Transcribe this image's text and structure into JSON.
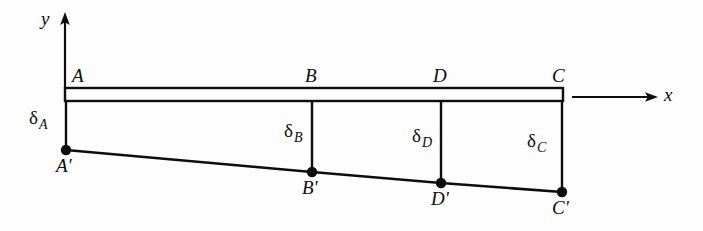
{
  "figure": {
    "type": "engineering-line-diagram",
    "background_color": "#fdfdfd",
    "stroke_color": "#0d0d0d",
    "axes": {
      "y_label": "y",
      "x_label": "x",
      "y_axis": {
        "x": 65,
        "y_top": 14,
        "y_bottom": 88,
        "arrow": "up"
      },
      "x_axis": {
        "y": 97,
        "x_start": 572,
        "x_end": 657,
        "arrow": "right"
      }
    },
    "beam": {
      "left": 65,
      "right": 563,
      "top": 88,
      "bottom": 101,
      "description": "undeformed beam drawn as a thin horizontal rectangle"
    },
    "nodes_top": [
      {
        "label": "A",
        "x": 65,
        "y": 88,
        "label_x": 72,
        "label_y": 66
      },
      {
        "label": "B",
        "x": 312,
        "y": 88,
        "label_x": 305,
        "label_y": 66
      },
      {
        "label": "D",
        "x": 441,
        "y": 88,
        "label_x": 433,
        "label_y": 66
      },
      {
        "label": "C",
        "x": 563,
        "y": 88,
        "label_x": 552,
        "label_y": 66
      }
    ],
    "nodes_bottom": [
      {
        "label": "A'",
        "x": 66,
        "y": 150,
        "label_x": 57,
        "label_y": 156
      },
      {
        "label": "B'",
        "x": 312,
        "y": 172,
        "label_x": 303,
        "label_y": 178
      },
      {
        "label": "D'",
        "x": 441,
        "y": 183,
        "label_x": 432,
        "label_y": 189
      },
      {
        "label": "C'",
        "x": 562,
        "y": 192,
        "label_x": 553,
        "label_y": 198
      }
    ],
    "deflections": [
      {
        "symbol": "δ",
        "subscript": "A",
        "x": 30,
        "y": 110,
        "from_y": 101,
        "to_y": 150,
        "at_x": 65
      },
      {
        "symbol": "δ",
        "subscript": "B",
        "x": 285,
        "y": 123,
        "from_y": 101,
        "to_y": 172,
        "at_x": 312
      },
      {
        "symbol": "δ",
        "subscript": "D",
        "x": 413,
        "y": 128,
        "from_y": 101,
        "to_y": 183,
        "at_x": 441
      },
      {
        "symbol": "δ",
        "subscript": "C",
        "x": 528,
        "y": 133,
        "from_y": 101,
        "to_y": 192,
        "at_x": 563
      }
    ],
    "deflection_curve": {
      "description": "deformed axis of beam through A', B', D', C'",
      "points": [
        [
          66,
          150
        ],
        [
          312,
          172
        ],
        [
          441,
          183
        ],
        [
          562,
          192
        ]
      ]
    }
  }
}
